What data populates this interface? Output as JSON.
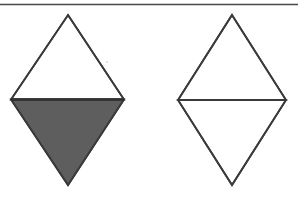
{
  "figure": {
    "canvas": {
      "width": 298,
      "height": 199,
      "background": "#ffffff"
    },
    "stroke_color": "#3a3a3a",
    "stroke_width": 1.8,
    "shaded_fill": "#5e5e5e",
    "unshaded_fill": "#ffffff",
    "rule": {
      "name": "top-horizontal-rule",
      "x1": 0,
      "y1": 4.5,
      "x2": 298,
      "y2": 4.5,
      "color": "#4a4a4a",
      "width": 1.6
    },
    "shapes": [
      {
        "name": "left-rhombus",
        "label": "",
        "top": {
          "x": 68,
          "y": 15
        },
        "right": {
          "x": 124,
          "y": 99.5
        },
        "bottom": {
          "x": 68,
          "y": 185
        },
        "left": {
          "x": 11,
          "y": 99.5
        },
        "upper_half_fill": "#ffffff",
        "lower_half_fill": "#5e5e5e",
        "midline": {
          "x1": 11,
          "y1": 99.5,
          "x2": 124,
          "y2": 99.5,
          "color": "#2f2f2f",
          "width": 2.4
        }
      },
      {
        "name": "right-rhombus",
        "label": "",
        "top": {
          "x": 232,
          "y": 15
        },
        "right": {
          "x": 286,
          "y": 100
        },
        "bottom": {
          "x": 232,
          "y": 185
        },
        "left": {
          "x": 178,
          "y": 100
        },
        "upper_half_fill": "#ffffff",
        "lower_half_fill": "#ffffff",
        "midline": null
      }
    ],
    "artifacts": [
      {
        "name": "scan-speck",
        "x": 107,
        "y": 62,
        "r": 0.7,
        "color": "#b8b8b8"
      },
      {
        "name": "scan-speck",
        "x": 104,
        "y": 65,
        "r": 0.5,
        "color": "#c8c8c8"
      }
    ]
  }
}
